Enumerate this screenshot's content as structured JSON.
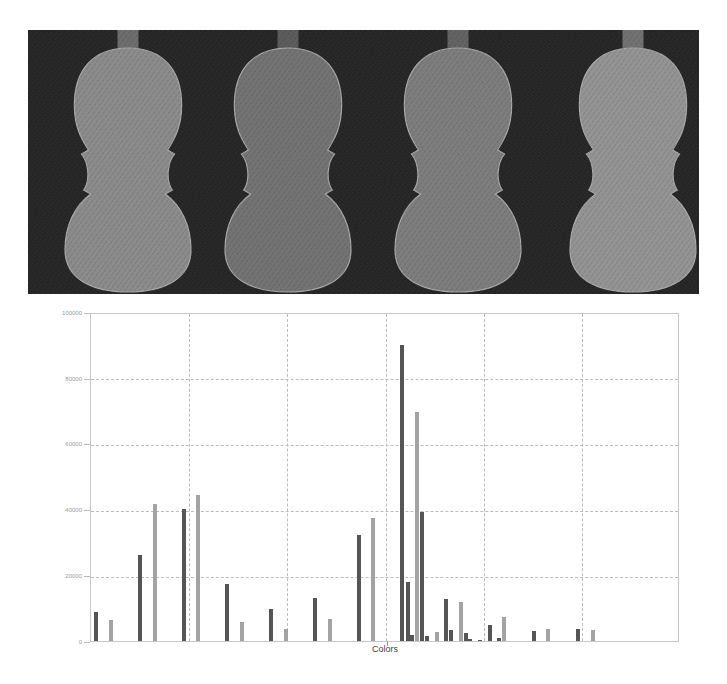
{
  "figure": {
    "photo": {
      "description": "Four violin backs photographed on a dark background",
      "background_color": "#262626",
      "violins": [
        {
          "label": "violin-1",
          "tone": "#8a8a8a",
          "x": 30
        },
        {
          "label": "violin-2",
          "tone": "#727272",
          "x": 190
        },
        {
          "label": "violin-3",
          "tone": "#7c7c7c",
          "x": 360
        },
        {
          "label": "violin-4",
          "tone": "#929292",
          "x": 535
        }
      ]
    }
  },
  "chart_data": {
    "type": "bar",
    "title": "",
    "xlabel": "Colors",
    "ylabel": "",
    "ylim": [
      0,
      100000
    ],
    "yticks": [
      "100000",
      "80000",
      "60000",
      "40000",
      "20000",
      "0"
    ],
    "grid": true,
    "legend": null,
    "x_gridline_count": 6,
    "series_colors": {
      "dark": "#555555",
      "light": "#a3a3a3"
    },
    "bars": [
      {
        "x": 95,
        "value": 8800,
        "shade": "dark"
      },
      {
        "x": 110,
        "value": 6400,
        "shade": "light"
      },
      {
        "x": 139,
        "value": 26100,
        "shade": "dark"
      },
      {
        "x": 154,
        "value": 41700,
        "shade": "light"
      },
      {
        "x": 183,
        "value": 40000,
        "shade": "dark"
      },
      {
        "x": 197,
        "value": 44200,
        "shade": "light"
      },
      {
        "x": 226,
        "value": 17200,
        "shade": "dark"
      },
      {
        "x": 241,
        "value": 5800,
        "shade": "light"
      },
      {
        "x": 270,
        "value": 9500,
        "shade": "dark"
      },
      {
        "x": 285,
        "value": 3500,
        "shade": "light"
      },
      {
        "x": 314,
        "value": 13100,
        "shade": "dark"
      },
      {
        "x": 329,
        "value": 6500,
        "shade": "light"
      },
      {
        "x": 358,
        "value": 32200,
        "shade": "dark"
      },
      {
        "x": 372,
        "value": 37300,
        "shade": "light"
      },
      {
        "x": 401,
        "value": 89900,
        "shade": "dark"
      },
      {
        "x": 407,
        "value": 17700,
        "shade": "dark"
      },
      {
        "x": 411,
        "value": 1800,
        "shade": "dark"
      },
      {
        "x": 416,
        "value": 69400,
        "shade": "light"
      },
      {
        "x": 421,
        "value": 39000,
        "shade": "dark"
      },
      {
        "x": 426,
        "value": 1300,
        "shade": "dark"
      },
      {
        "x": 436,
        "value": 2500,
        "shade": "light"
      },
      {
        "x": 445,
        "value": 12700,
        "shade": "dark"
      },
      {
        "x": 450,
        "value": 3400,
        "shade": "dark"
      },
      {
        "x": 460,
        "value": 11700,
        "shade": "light"
      },
      {
        "x": 465,
        "value": 2300,
        "shade": "dark"
      },
      {
        "x": 469,
        "value": 500,
        "shade": "dark"
      },
      {
        "x": 479,
        "value": 300,
        "shade": "dark"
      },
      {
        "x": 489,
        "value": 4700,
        "shade": "dark"
      },
      {
        "x": 498,
        "value": 900,
        "shade": "dark"
      },
      {
        "x": 503,
        "value": 7100,
        "shade": "light"
      },
      {
        "x": 533,
        "value": 3100,
        "shade": "dark"
      },
      {
        "x": 547,
        "value": 3700,
        "shade": "light"
      },
      {
        "x": 577,
        "value": 3700,
        "shade": "dark"
      },
      {
        "x": 592,
        "value": 3400,
        "shade": "light"
      }
    ]
  }
}
